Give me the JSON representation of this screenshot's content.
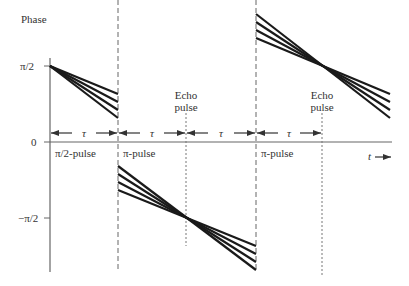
{
  "diagram": {
    "type": "spin-echo phase diagram",
    "y_axis": {
      "label": "Phase",
      "ticks": [
        {
          "label": "π/2",
          "y": 66
        },
        {
          "label": "0",
          "y": 142
        },
        {
          "label": "−π/2",
          "y": 218
        }
      ]
    },
    "x_axis": {
      "label": "t",
      "arrow": "→"
    },
    "pulses": [
      {
        "label": "π/2-pulse",
        "x": 50,
        "style": "solid"
      },
      {
        "label": "π-pulse",
        "x": 118,
        "style": "dashed"
      },
      {
        "label": "π-pulse",
        "x": 256,
        "style": "dashed"
      }
    ],
    "echoes": [
      {
        "label_line1": "Echo",
        "label_line2": "pulse",
        "x": 186
      },
      {
        "label_line1": "Echo",
        "label_line2": "pulse",
        "x": 322
      }
    ],
    "intervals": [
      {
        "label": "τ",
        "x1": 50,
        "x2": 118
      },
      {
        "label": "τ",
        "x1": 118,
        "x2": 186
      },
      {
        "label": "τ",
        "x1": 186,
        "x2": 256
      },
      {
        "label": "τ",
        "x1": 256,
        "x2": 322
      }
    ],
    "line_groups": [
      {
        "name": "dephase-1",
        "from": [
          50,
          66
        ],
        "ends_x": 118,
        "ends_y": [
          94,
          102,
          110,
          118
        ]
      },
      {
        "name": "refocus-1",
        "starts_x": 118,
        "starts_y": [
          166,
          174,
          182,
          190
        ],
        "converge": [
          186,
          218
        ],
        "ends_x": 256,
        "ends_y": [
          246,
          254,
          262,
          270
        ]
      },
      {
        "name": "refocus-2",
        "starts_x": 256,
        "starts_y": [
          14,
          22,
          30,
          38
        ],
        "converge": [
          322,
          66
        ],
        "ends_x": 390,
        "ends_y": [
          94,
          102,
          110,
          118
        ]
      }
    ],
    "colors": {
      "line": "#1a1a1a",
      "axis": "#666666",
      "text": "#333333"
    }
  }
}
